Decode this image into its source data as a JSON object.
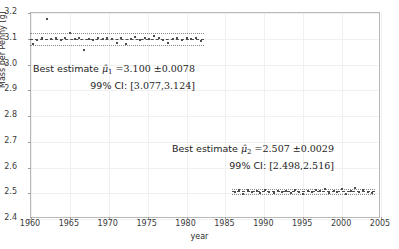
{
  "chart_data": {
    "type": "scatter",
    "title": "",
    "xlabel": "year",
    "ylabel": "Mass per Penny [g]",
    "xlim": [
      1960,
      2005
    ],
    "ylim": [
      2.4,
      3.2
    ],
    "xticks": [
      1960,
      1965,
      1970,
      1975,
      1980,
      1985,
      1990,
      1995,
      2000,
      2005
    ],
    "yticks": [
      "2.4",
      "2.5",
      "2.6",
      "2.7",
      "2.8",
      "2.9",
      "3.0",
      "3.1",
      "3.2"
    ],
    "grid": true,
    "legend": "none",
    "series": [
      {
        "name": "pre-1982 pennies",
        "mean": 3.1,
        "sem": 0.0078,
        "ci99": [
          3.077,
          3.124
        ],
        "points": [
          {
            "x": 1960.3,
            "y": 3.081
          },
          {
            "x": 1960.8,
            "y": 3.096
          },
          {
            "x": 1961.4,
            "y": 3.104
          },
          {
            "x": 1962.0,
            "y": 3.175
          },
          {
            "x": 1962.6,
            "y": 3.099
          },
          {
            "x": 1963.2,
            "y": 3.101
          },
          {
            "x": 1963.8,
            "y": 3.097
          },
          {
            "x": 1964.4,
            "y": 3.103
          },
          {
            "x": 1965.0,
            "y": 3.122
          },
          {
            "x": 1965.6,
            "y": 3.098
          },
          {
            "x": 1966.2,
            "y": 3.102
          },
          {
            "x": 1966.8,
            "y": 3.058
          },
          {
            "x": 1967.4,
            "y": 3.1
          },
          {
            "x": 1968.0,
            "y": 3.096
          },
          {
            "x": 1968.6,
            "y": 3.104
          },
          {
            "x": 1969.2,
            "y": 3.099
          },
          {
            "x": 1969.8,
            "y": 3.101
          },
          {
            "x": 1970.4,
            "y": 3.098
          },
          {
            "x": 1971.0,
            "y": 3.083
          },
          {
            "x": 1971.6,
            "y": 3.102
          },
          {
            "x": 1972.2,
            "y": 3.081
          },
          {
            "x": 1972.8,
            "y": 3.1
          },
          {
            "x": 1973.4,
            "y": 3.105
          },
          {
            "x": 1974.0,
            "y": 3.096
          },
          {
            "x": 1974.6,
            "y": 3.103
          },
          {
            "x": 1975.2,
            "y": 3.099
          },
          {
            "x": 1975.8,
            "y": 3.111
          },
          {
            "x": 1976.4,
            "y": 3.101
          },
          {
            "x": 1977.0,
            "y": 3.097
          },
          {
            "x": 1977.6,
            "y": 3.082
          },
          {
            "x": 1978.2,
            "y": 3.1
          },
          {
            "x": 1978.8,
            "y": 3.104
          },
          {
            "x": 1979.4,
            "y": 3.096
          },
          {
            "x": 1980.0,
            "y": 3.101
          },
          {
            "x": 1980.6,
            "y": 3.099
          },
          {
            "x": 1981.2,
            "y": 3.103
          },
          {
            "x": 1981.8,
            "y": 3.091
          }
        ]
      },
      {
        "name": "post-1982 pennies",
        "mean": 2.507,
        "sem": 0.0029,
        "ci99": [
          2.498,
          2.516
        ],
        "points": [
          {
            "x": 1986.2,
            "y": 2.504
          },
          {
            "x": 1986.8,
            "y": 2.511
          },
          {
            "x": 1987.3,
            "y": 2.499
          },
          {
            "x": 1987.9,
            "y": 2.514
          },
          {
            "x": 1988.4,
            "y": 2.505
          },
          {
            "x": 1989.0,
            "y": 2.509
          },
          {
            "x": 1989.5,
            "y": 2.502
          },
          {
            "x": 1990.1,
            "y": 2.512
          },
          {
            "x": 1990.6,
            "y": 2.506
          },
          {
            "x": 1991.2,
            "y": 2.5
          },
          {
            "x": 1991.7,
            "y": 2.51
          },
          {
            "x": 1992.3,
            "y": 2.504
          },
          {
            "x": 1992.8,
            "y": 2.508
          },
          {
            "x": 1993.4,
            "y": 2.501
          },
          {
            "x": 1993.9,
            "y": 2.513
          },
          {
            "x": 1994.5,
            "y": 2.506
          },
          {
            "x": 1995.0,
            "y": 2.498
          },
          {
            "x": 1995.6,
            "y": 2.509
          },
          {
            "x": 1996.1,
            "y": 2.503
          },
          {
            "x": 1996.7,
            "y": 2.512
          },
          {
            "x": 1997.2,
            "y": 2.507
          },
          {
            "x": 1997.8,
            "y": 2.518
          },
          {
            "x": 1998.3,
            "y": 2.502
          },
          {
            "x": 1998.9,
            "y": 2.51
          },
          {
            "x": 1999.4,
            "y": 2.505
          },
          {
            "x": 2000.0,
            "y": 2.516
          },
          {
            "x": 2000.5,
            "y": 2.499
          },
          {
            "x": 2001.1,
            "y": 2.508
          },
          {
            "x": 2001.6,
            "y": 2.52
          },
          {
            "x": 2002.2,
            "y": 2.503
          },
          {
            "x": 2002.7,
            "y": 2.511
          },
          {
            "x": 2003.3,
            "y": 2.506
          },
          {
            "x": 2003.8,
            "y": 2.5
          }
        ]
      }
    ],
    "annotations": [
      {
        "id": "annot1",
        "line1_prefix": "Best estimate ",
        "line1_mu": "μ̂",
        "line1_sub": "1",
        "line1_value": " =3.100 ±0.0078",
        "line2_label": "99% CI: ",
        "line2_value": "[3.077,3.124]"
      },
      {
        "id": "annot2",
        "line1_prefix": "Best estimate ",
        "line1_mu": "μ̂",
        "line1_sub": "2",
        "line1_value": " =2.507 ±0.0029",
        "line2_label": "99% CI: ",
        "line2_value": "[2.498,2.516]"
      }
    ],
    "colors": {
      "point": "#4d4d4d",
      "mean_line": "#4a4a4a",
      "ci_line": "#8a8a8a",
      "grid": "#f0f0f0",
      "frame": "#b8b8b8",
      "background": "#ffffff"
    }
  }
}
